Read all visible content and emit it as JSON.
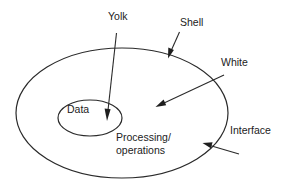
{
  "diagram": {
    "type": "egg-model",
    "labels": {
      "yolk": "Yolk",
      "shell": "Shell",
      "white": "White",
      "interface": "Interface",
      "data": "Data",
      "processing_line1": "Processing/",
      "processing_line2": "operations"
    },
    "regions": [
      {
        "name": "Yolk",
        "contains": "Data"
      },
      {
        "name": "White",
        "contains": "Processing/operations"
      },
      {
        "name": "Shell",
        "contains": "Interface"
      }
    ],
    "colors": {
      "stroke": "#2a2a2a",
      "text": "#222222",
      "background": "#ffffff"
    }
  }
}
